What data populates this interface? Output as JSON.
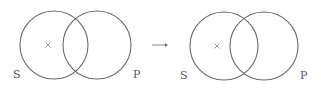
{
  "diagrams": [
    {
      "left_set": {
        "label": "S",
        "cx": 54,
        "cy": 45,
        "r": 34
      },
      "right_set": {
        "label": "P",
        "cx": 97,
        "cy": 45,
        "r": 34
      },
      "mark": {
        "symbol": "×",
        "x": 48,
        "y": 45,
        "region": "S only"
      },
      "label_positions": {
        "S": [
          13,
          78
        ],
        "P": [
          133,
          78
        ]
      }
    },
    {
      "left_set": {
        "label": "S",
        "cx": 224,
        "cy": 46,
        "r": 34
      },
      "right_set": {
        "label": "P",
        "cx": 264,
        "cy": 46,
        "r": 34
      },
      "mark": {
        "symbol": "×",
        "x": 217,
        "y": 46,
        "region": "S only"
      },
      "label_positions": {
        "S": [
          180,
          79
        ],
        "P": [
          300,
          79
        ]
      }
    }
  ],
  "arrow": {
    "symbol": "→"
  },
  "colors": {
    "stroke": "#6a6a6a",
    "mark": "#9a9a9a",
    "text": "#555555"
  }
}
